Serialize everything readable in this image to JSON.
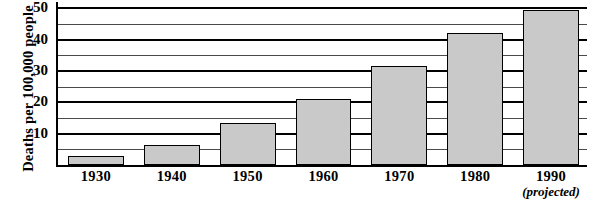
{
  "chart_data": {
    "type": "bar",
    "title": "",
    "xlabel": "",
    "ylabel": "Deaths per 100,000 people",
    "categories": [
      "1930",
      "1940",
      "1950",
      "1960",
      "1970",
      "1980",
      "1990"
    ],
    "category_sublabels": [
      "",
      "",
      "",
      "",
      "",
      "",
      "(projected)"
    ],
    "values": [
      3,
      6.5,
      13.5,
      21,
      31.5,
      42,
      49.5
    ],
    "ylim": [
      0,
      52
    ],
    "yticks_major": [
      10,
      20,
      30,
      40,
      50
    ],
    "yticks_minor": [
      5,
      15,
      25,
      35,
      45
    ],
    "ytick_labels": [
      "10",
      "20",
      "30",
      "40",
      "50"
    ],
    "grid": true,
    "legend": "none",
    "bar_fill_color": "#c9c9c9",
    "bar_edge_color": "#000000",
    "axis_color": "#000000"
  },
  "axis": {
    "y_title": "Deaths per 100,000 people"
  },
  "caption": {
    "text": ""
  }
}
